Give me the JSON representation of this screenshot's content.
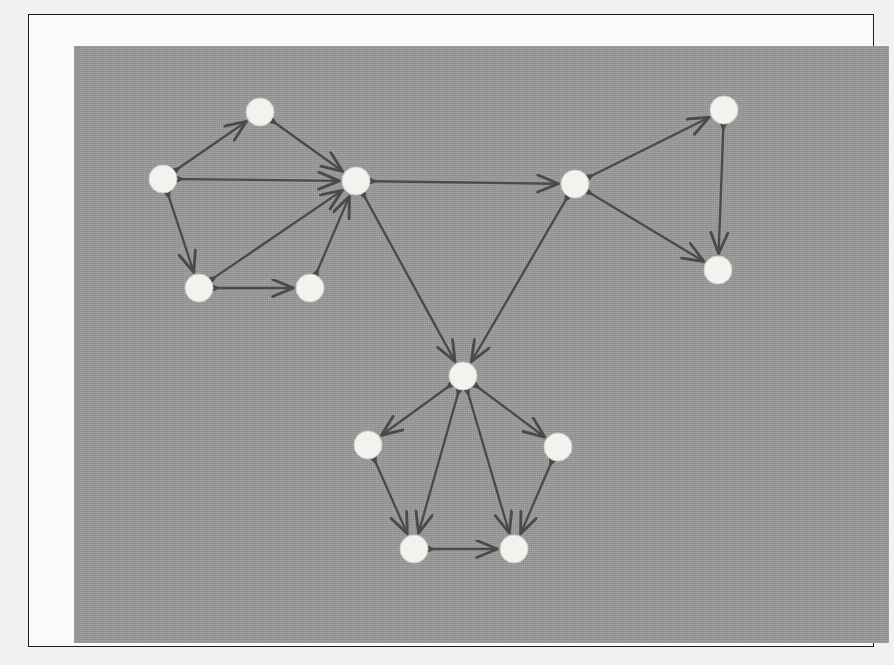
{
  "figure": {
    "kind": "directed-graph-diagram",
    "background_color": "#9a9a9a",
    "page_color": "#f4f3f1",
    "border_color": "#1c1c1c",
    "node_fill": "#f2f2ef",
    "node_stroke": "#cfcfca",
    "edge_color": "#4a4a4a",
    "node_radius": 14,
    "edge_width": 2.3,
    "plot_area": {
      "x": 45,
      "y": 31,
      "width": 815,
      "height": 597
    },
    "frame": {
      "x": 28,
      "y": 14,
      "width": 846,
      "height": 633
    }
  },
  "chart_data": {
    "type": "diagram",
    "title": "",
    "xlabel": "",
    "ylabel": "",
    "directed": true,
    "clusters": [
      {
        "name": "left-cluster",
        "hub": "L0",
        "members": [
          "L0",
          "L1",
          "L2",
          "L3",
          "L4"
        ]
      },
      {
        "name": "right-cluster",
        "hub": "R0",
        "members": [
          "R0",
          "R1",
          "R2"
        ]
      },
      {
        "name": "bottom-cluster",
        "hub": "B0",
        "members": [
          "B0",
          "B1",
          "B2",
          "B3",
          "B4"
        ]
      }
    ],
    "nodes": [
      {
        "id": "L0",
        "x": 356,
        "y": 181,
        "cluster": "left-cluster",
        "role": "hub",
        "degree": 6
      },
      {
        "id": "L1",
        "x": 260,
        "y": 112,
        "cluster": "left-cluster",
        "role": "satellite",
        "degree": 2
      },
      {
        "id": "L2",
        "x": 163,
        "y": 179,
        "cluster": "left-cluster",
        "role": "satellite",
        "degree": 3
      },
      {
        "id": "L3",
        "x": 199,
        "y": 288,
        "cluster": "left-cluster",
        "role": "satellite",
        "degree": 3
      },
      {
        "id": "L4",
        "x": 310,
        "y": 288,
        "cluster": "left-cluster",
        "role": "satellite",
        "degree": 2
      },
      {
        "id": "R0",
        "x": 575,
        "y": 184,
        "cluster": "right-cluster",
        "role": "hub",
        "degree": 4
      },
      {
        "id": "R1",
        "x": 724,
        "y": 110,
        "cluster": "right-cluster",
        "role": "satellite",
        "degree": 2
      },
      {
        "id": "R2",
        "x": 718,
        "y": 270,
        "cluster": "right-cluster",
        "role": "satellite",
        "degree": 2
      },
      {
        "id": "B0",
        "x": 463,
        "y": 376,
        "cluster": "bottom-cluster",
        "role": "hub",
        "degree": 6
      },
      {
        "id": "B1",
        "x": 368,
        "y": 445,
        "cluster": "bottom-cluster",
        "role": "satellite",
        "degree": 2
      },
      {
        "id": "B2",
        "x": 558,
        "y": 447,
        "cluster": "bottom-cluster",
        "role": "satellite",
        "degree": 2
      },
      {
        "id": "B3",
        "x": 414,
        "y": 549,
        "cluster": "bottom-cluster",
        "role": "satellite",
        "degree": 3
      },
      {
        "id": "B4",
        "x": 514,
        "y": 549,
        "cluster": "bottom-cluster",
        "role": "satellite",
        "degree": 3
      }
    ],
    "edges": [
      {
        "source": "L2",
        "target": "L1",
        "bidirectional": true
      },
      {
        "source": "L1",
        "target": "L0",
        "bidirectional": true
      },
      {
        "source": "L2",
        "target": "L0",
        "bidirectional": true
      },
      {
        "source": "L2",
        "target": "L3",
        "bidirectional": true
      },
      {
        "source": "L3",
        "target": "L0",
        "bidirectional": true
      },
      {
        "source": "L3",
        "target": "L4",
        "bidirectional": true
      },
      {
        "source": "L4",
        "target": "L0",
        "bidirectional": true
      },
      {
        "source": "L0",
        "target": "R0",
        "bidirectional": true
      },
      {
        "source": "R0",
        "target": "R1",
        "bidirectional": true
      },
      {
        "source": "R0",
        "target": "R2",
        "bidirectional": true
      },
      {
        "source": "R1",
        "target": "R2",
        "bidirectional": true
      },
      {
        "source": "L0",
        "target": "B0",
        "bidirectional": true
      },
      {
        "source": "R0",
        "target": "B0",
        "bidirectional": true
      },
      {
        "source": "B0",
        "target": "B1",
        "bidirectional": true
      },
      {
        "source": "B0",
        "target": "B2",
        "bidirectional": true
      },
      {
        "source": "B0",
        "target": "B3",
        "bidirectional": true
      },
      {
        "source": "B0",
        "target": "B4",
        "bidirectional": true
      },
      {
        "source": "B1",
        "target": "B3",
        "bidirectional": true
      },
      {
        "source": "B2",
        "target": "B4",
        "bidirectional": true
      },
      {
        "source": "B3",
        "target": "B4",
        "bidirectional": true
      }
    ],
    "counts": {
      "nodes": 13,
      "edges": 20
    }
  }
}
